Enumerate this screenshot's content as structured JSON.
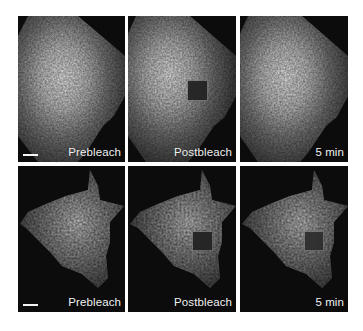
{
  "figure": {
    "background": "#ffffff",
    "rows": [
      {
        "name": "row-1",
        "panels": [
          {
            "label": "Prebleach",
            "scale_bar": true,
            "bleach_box": false
          },
          {
            "label": "Postbleach",
            "scale_bar": false,
            "bleach_box": true
          },
          {
            "label": "5 min",
            "scale_bar": false,
            "bleach_box": false
          }
        ]
      },
      {
        "name": "row-2",
        "panels": [
          {
            "label": "Prebleach",
            "scale_bar": true,
            "bleach_box": false
          },
          {
            "label": "Postbleach",
            "scale_bar": false,
            "bleach_box": true
          },
          {
            "label": "5 min",
            "scale_bar": false,
            "bleach_box": true
          }
        ]
      }
    ]
  }
}
